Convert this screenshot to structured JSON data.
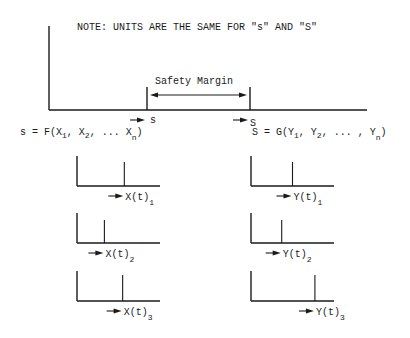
{
  "note": "NOTE:  UNITS ARE THE SAME FOR \"s\" AND \"S\"",
  "main": {
    "safety_margin_label": "Safety Margin",
    "s_marker_label": "s",
    "S_marker_label": "S"
  },
  "left": {
    "formula_prefix": "s = F(X",
    "formula_sub1": "1",
    "formula_mid1": ", X",
    "formula_sub2": "2",
    "formula_mid2": ", ... X",
    "formula_subn": "n",
    "formula_end": ")",
    "plots": [
      {
        "label": "X(t)",
        "sub": "1",
        "spike_pos": 0.57
      },
      {
        "label": "X(t)",
        "sub": "2",
        "spike_pos": 0.33
      },
      {
        "label": "X(t)",
        "sub": "3",
        "spike_pos": 0.55
      }
    ]
  },
  "right": {
    "formula_prefix": "S = G(Y",
    "formula_sub1": "1",
    "formula_mid1": ", Y",
    "formula_sub2": "2",
    "formula_mid2": ", ... , Y",
    "formula_subn": "n",
    "formula_end": ")",
    "plots": [
      {
        "label": "Y(t)",
        "sub": "1",
        "spike_pos": 0.5
      },
      {
        "label": "Y(t)",
        "sub": "2",
        "spike_pos": 0.37
      },
      {
        "label": "Y(t)",
        "sub": "3",
        "spike_pos": 0.77
      }
    ]
  }
}
